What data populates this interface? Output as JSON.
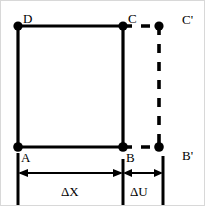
{
  "figure": {
    "background_color": "#ffffff",
    "stroke_color": "#000000",
    "border_color": "#d8d8d8",
    "width": 205,
    "height": 206,
    "vertices": [
      {
        "id": "A",
        "label": "A",
        "x": 17,
        "y": 146,
        "label_x": 20,
        "label_y": 150,
        "style": "filled-dot"
      },
      {
        "id": "B",
        "label": "B",
        "x": 122,
        "y": 146,
        "label_x": 125,
        "label_y": 150,
        "style": "filled-dot"
      },
      {
        "id": "C",
        "label": "C",
        "x": 122,
        "y": 25,
        "label_x": 127,
        "label_y": 11,
        "style": "filled-dot"
      },
      {
        "id": "D",
        "label": "D",
        "x": 17,
        "y": 25,
        "label_x": 22,
        "label_y": 11,
        "style": "filled-dot"
      },
      {
        "id": "Bp",
        "label": "B'",
        "x": 158,
        "y": 146,
        "label_x": 181,
        "label_y": 148,
        "style": "filled-dot"
      },
      {
        "id": "Cp",
        "label": "C'",
        "x": 158,
        "y": 25,
        "label_x": 181,
        "label_y": 12,
        "style": "filled-dot"
      }
    ],
    "solid_edges": [
      {
        "name": "edge-D-C",
        "from": "D",
        "to": "C"
      },
      {
        "name": "edge-C-B",
        "from": "C",
        "to": "B"
      },
      {
        "name": "edge-B-A",
        "from": "B",
        "to": "A"
      },
      {
        "name": "edge-A-D",
        "from": "A",
        "to": "D"
      }
    ],
    "dashed_edges": [
      {
        "name": "edge-C-Cprime",
        "from": "C",
        "to": "Cp"
      },
      {
        "name": "edge-B-Bprime",
        "from": "B",
        "to": "Bp"
      },
      {
        "name": "edge-Cprime-Bprime",
        "from": "Cp",
        "to": "Bp"
      }
    ],
    "dimensions": [
      {
        "id": "dx",
        "label": "ΔX",
        "label_x": 60,
        "label_y": 184,
        "arrow_y": 172,
        "x_start": 17,
        "x_end": 122
      },
      {
        "id": "du",
        "label": "ΔU",
        "label_x": 129,
        "label_y": 184,
        "arrow_y": 172,
        "x_start": 122,
        "x_end": 162
      }
    ],
    "extension_lines": [
      {
        "name": "extension-line-A",
        "x": 17,
        "y_top": 152,
        "y_bottom": 206
      },
      {
        "name": "extension-line-B",
        "x": 122,
        "y_top": 158,
        "y_bottom": 206
      },
      {
        "name": "extension-line-Bprime",
        "x": 162,
        "y_top": 155,
        "y_bottom": 206
      }
    ]
  }
}
